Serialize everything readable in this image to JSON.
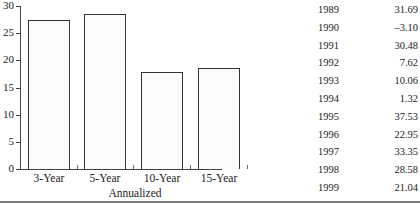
{
  "chart_data": {
    "type": "bar",
    "title": "",
    "xlabel": "Annualized",
    "ylabel": "",
    "ylim": [
      0,
      30
    ],
    "yticks": [
      0,
      5,
      10,
      15,
      20,
      25,
      30
    ],
    "categories": [
      "3-Year",
      "5-Year",
      "10-Year",
      "15-Year"
    ],
    "values": [
      27.5,
      28.5,
      17.9,
      18.6
    ],
    "grid": false,
    "legend": null,
    "table": {
      "rows": [
        {
          "year": "1989",
          "value": "31.69"
        },
        {
          "year": "1990",
          "value": "–3.10"
        },
        {
          "year": "1991",
          "value": "30.48"
        },
        {
          "year": "1992",
          "value": "7.62"
        },
        {
          "year": "1993",
          "value": "10.06"
        },
        {
          "year": "1994",
          "value": "1.32"
        },
        {
          "year": "1995",
          "value": "37.53"
        },
        {
          "year": "1996",
          "value": "22.95"
        },
        {
          "year": "1997",
          "value": "33.35"
        },
        {
          "year": "1998",
          "value": "28.58"
        },
        {
          "year": "1999",
          "value": "21.04"
        }
      ]
    }
  },
  "axis": {
    "y_labels": [
      "30",
      "25",
      "20",
      "15",
      "10",
      "5",
      "0"
    ],
    "x_title": "Annualized"
  }
}
